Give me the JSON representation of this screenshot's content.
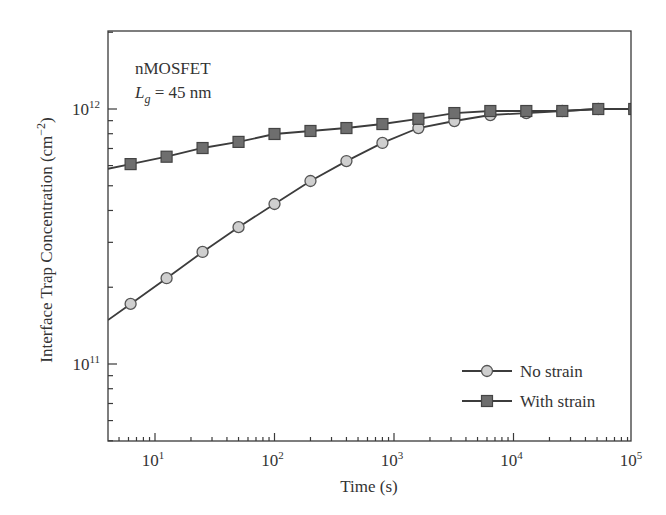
{
  "chart_data": {
    "type": "line",
    "title": "",
    "annotation": {
      "line1": "nMOSFET",
      "line2_symbol": "L",
      "line2_subscript": "g",
      "line2_rest": " = 45 nm"
    },
    "xlabel": "Time (s)",
    "ylabel": "Interface Trap Concentration (cm",
    "ylabel_sup": "−2",
    "ylabel_close": ")",
    "xscale": "log",
    "yscale": "log",
    "xlim": [
      4,
      130000
    ],
    "ylim": [
      50000000000.0,
      2000000000000.0
    ],
    "x_ticks": [
      {
        "value": 10,
        "base": "10",
        "exp": "1"
      },
      {
        "value": 100,
        "base": "10",
        "exp": "2"
      },
      {
        "value": 1000,
        "base": "10",
        "exp": "3"
      },
      {
        "value": 10000,
        "base": "10",
        "exp": "4"
      },
      {
        "value": 100000,
        "base": "10",
        "exp": "5"
      }
    ],
    "y_ticks": [
      {
        "value": 100000000000.0,
        "base": "10",
        "exp": "11"
      },
      {
        "value": 1000000000000.0,
        "base": "10",
        "exp": "12"
      }
    ],
    "grid": false,
    "legend_position": "lower right",
    "x": [
      6.25,
      12.5,
      25,
      50,
      100,
      200,
      400,
      800,
      1600,
      3200,
      6400,
      12800,
      25600,
      51200,
      102400
    ],
    "series": [
      {
        "name": "No strain",
        "marker": "circle",
        "marker_fill": "#cfcfcf",
        "marker_edge": "#555555",
        "values": [
          172000000000.0,
          217000000000.0,
          275000000000.0,
          344000000000.0,
          424000000000.0,
          522000000000.0,
          625000000000.0,
          736000000000.0,
          842000000000.0,
          897000000000.0,
          947000000000.0,
          964000000000.0,
          982000000000.0,
          1000000000000.0,
          1000000000000.0
        ]
      },
      {
        "name": "With strain",
        "marker": "square",
        "marker_fill": "#6e6e6e",
        "marker_edge": "#444444",
        "values": [
          608000000000.0,
          650000000000.0,
          703000000000.0,
          743000000000.0,
          798000000000.0,
          820000000000.0,
          842000000000.0,
          873000000000.0,
          915000000000.0,
          964000000000.0,
          982000000000.0,
          982000000000.0,
          982000000000.0,
          1000000000000.0,
          1000000000000.0
        ]
      }
    ]
  }
}
